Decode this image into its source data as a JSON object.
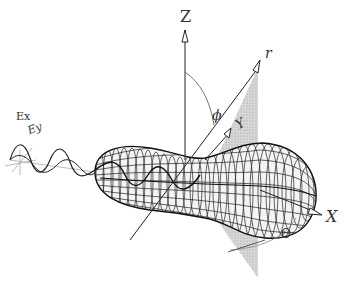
{
  "figure": {
    "kind": "3D light-scattering diagram",
    "labels": {
      "z_axis": "Z",
      "x_axis": "X",
      "y_axis": "Y",
      "r_axis": "r",
      "phi": "ϕ",
      "theta": "Θ",
      "ex": "Ex",
      "ey": "Ey"
    },
    "colors": {
      "line": "#222222",
      "plane": "#c8c8c8",
      "guide": "#aaaaaa"
    }
  }
}
